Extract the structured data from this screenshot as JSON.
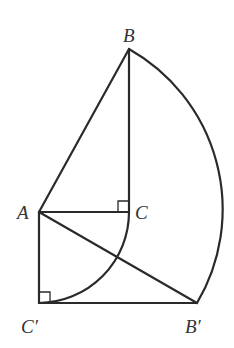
{
  "diagram": {
    "type": "geometry-rotation-figure",
    "points": {
      "A": {
        "label": "A",
        "x": 39,
        "y": 212
      },
      "B": {
        "label": "B",
        "x": 129,
        "y": 49
      },
      "C": {
        "label": "C",
        "x": 129,
        "y": 212
      },
      "C_prime": {
        "label": "C′",
        "x": 39,
        "y": 303
      },
      "B_prime": {
        "label": "B′",
        "x": 197,
        "y": 303
      }
    },
    "segments": [
      "AB",
      "BC",
      "AC",
      "AC′",
      "C′B′",
      "AB′"
    ],
    "arcs": [
      {
        "name": "arc-B-to-B-prime",
        "center": "A",
        "from": "B",
        "to": "B′"
      },
      {
        "name": "arc-C-to-C-prime",
        "center": "A",
        "from": "C",
        "to": "C′"
      }
    ],
    "right_angles": [
      "C",
      "C′"
    ],
    "stroke_color": "#2a2a2a",
    "label_color": "#333333"
  }
}
